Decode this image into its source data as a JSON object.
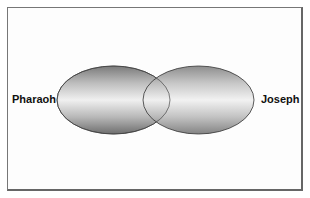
{
  "diagram": {
    "type": "venn",
    "sets": [
      {
        "label": "Pharaoh"
      },
      {
        "label": "Joseph"
      }
    ]
  }
}
